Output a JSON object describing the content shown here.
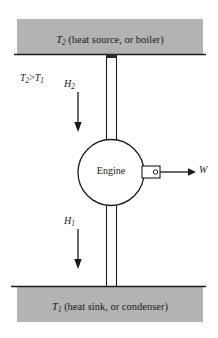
{
  "diagram": {
    "type": "thermodynamic-heat-engine-schematic",
    "background_color": "#ffffff",
    "stroke_color": "#1a1a1a",
    "reservoir_fill_color": "#b3b3b3",
    "reservoirs": {
      "hot": {
        "name": "hot-reservoir",
        "symbol": "T",
        "subscript": "2",
        "description": "(heat source, or boiler)",
        "label": "T2 (heat source, or boiler)"
      },
      "cold": {
        "name": "cold-reservoir",
        "symbol": "T",
        "subscript": "1",
        "description": "(heat sink, or condenser)",
        "label": "T1 (heat sink, or condenser)"
      }
    },
    "relation": {
      "name": "temperature-relation",
      "left_symbol": "T",
      "left_subscript": "2",
      "operator": ">",
      "right_symbol": "T",
      "right_subscript": "1",
      "label": "T2>T1"
    },
    "engine": {
      "name": "engine",
      "label": "Engine",
      "shape": "circle"
    },
    "heat_flows": [
      {
        "name": "heat-input-upper",
        "symbol": "H",
        "subscript": "2",
        "label": "H2",
        "direction": "down",
        "from": "hot-reservoir",
        "to": "engine"
      },
      {
        "name": "heat-output-lower",
        "symbol": "H",
        "subscript": "1",
        "label": "H1",
        "direction": "down",
        "from": "engine",
        "to": "cold-reservoir"
      }
    ],
    "work_output": {
      "name": "work-output",
      "symbol": "W",
      "label": "W",
      "direction": "right",
      "from": "engine"
    }
  }
}
